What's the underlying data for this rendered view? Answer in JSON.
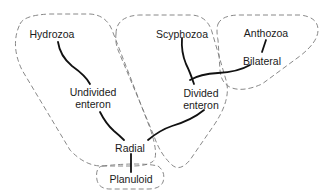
{
  "diagram": {
    "type": "cladogram",
    "nodes": {
      "hydrozoa": {
        "label": "Hydrozoa"
      },
      "scyphozoa": {
        "label": "Scyphozoa"
      },
      "anthozoa": {
        "label": "Anthozoa"
      },
      "undivided_enteron": {
        "line1": "Undivided",
        "line2": "enteron"
      },
      "divided_enteron": {
        "line1": "Divided",
        "line2": "enteron"
      },
      "bilateral": {
        "label": "Bilateral"
      },
      "radial": {
        "label": "Radial"
      },
      "planuloid": {
        "label": "Planuloid"
      }
    },
    "edges": [
      {
        "from": "Hydrozoa",
        "to": "Undivided enteron"
      },
      {
        "from": "Undivided enteron",
        "to": "Radial"
      },
      {
        "from": "Scyphozoa",
        "to": "Divided enteron"
      },
      {
        "from": "Anthozoa",
        "to": "Bilateral"
      },
      {
        "from": "Bilateral",
        "to": "Divided enteron"
      },
      {
        "from": "Divided enteron",
        "to": "Radial"
      },
      {
        "from": "Radial",
        "to": "Planuloid"
      }
    ],
    "groups": [
      {
        "name": "hydrozoa-group",
        "contains": [
          "Hydrozoa",
          "Undivided enteron",
          "Radial"
        ]
      },
      {
        "name": "scyphozoa-group",
        "contains": [
          "Scyphozoa",
          "Divided enteron"
        ]
      },
      {
        "name": "anthozoa-group",
        "contains": [
          "Anthozoa",
          "Bilateral"
        ]
      },
      {
        "name": "planuloid-group",
        "contains": [
          "Planuloid"
        ]
      }
    ],
    "colors": {
      "line": "#111111",
      "outline": "#7a7a7a",
      "text": "#1a1a1a",
      "background": "#ffffff"
    }
  }
}
